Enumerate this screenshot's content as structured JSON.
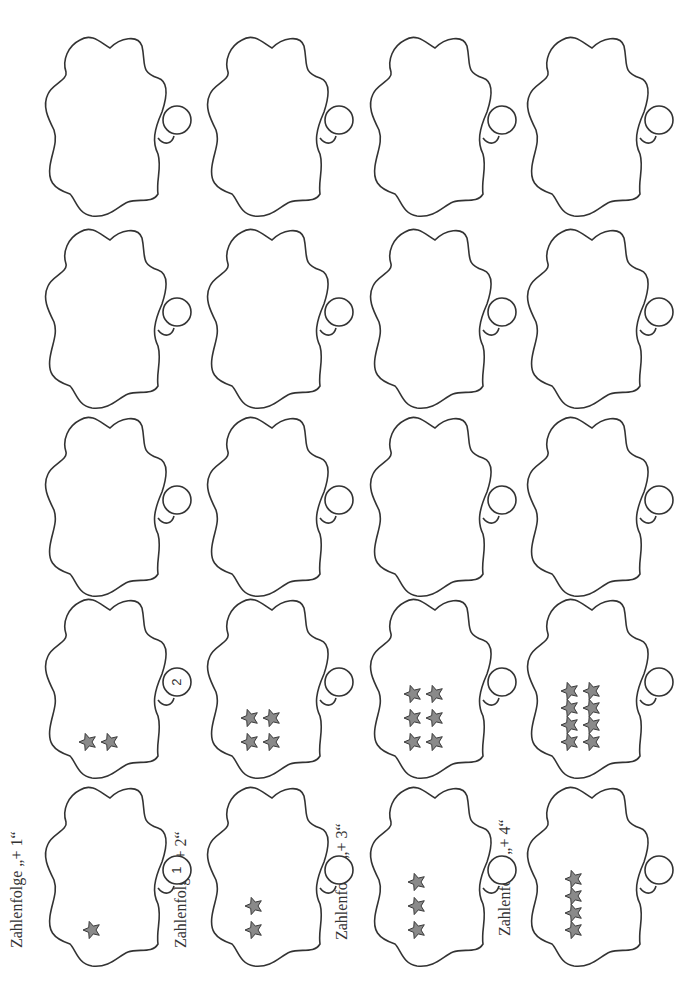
{
  "page": {
    "orientation": "rotated-90-ccw",
    "colors": {
      "outline": "#333333",
      "star_fill": "#8a8a8a",
      "star_stroke": "#3a3a3a",
      "background": "#ffffff"
    }
  },
  "rows": [
    {
      "label": "Zahlenfolge „+ 1“",
      "step": 1,
      "cells": [
        {
          "stars": 1,
          "bubble_number": "1"
        },
        {
          "stars": 2,
          "bubble_number": "2"
        },
        {
          "stars": 0,
          "bubble_number": ""
        },
        {
          "stars": 0,
          "bubble_number": ""
        },
        {
          "stars": 0,
          "bubble_number": ""
        }
      ]
    },
    {
      "label": "Zahlenfolge „+ 2“",
      "step": 2,
      "cells": [
        {
          "stars": 2,
          "bubble_number": ""
        },
        {
          "stars": 4,
          "bubble_number": ""
        },
        {
          "stars": 0,
          "bubble_number": ""
        },
        {
          "stars": 0,
          "bubble_number": ""
        },
        {
          "stars": 0,
          "bubble_number": ""
        }
      ]
    },
    {
      "label": "Zahlenfolge „+ 3“",
      "step": 3,
      "cells": [
        {
          "stars": 3,
          "bubble_number": ""
        },
        {
          "stars": 6,
          "bubble_number": ""
        },
        {
          "stars": 0,
          "bubble_number": ""
        },
        {
          "stars": 0,
          "bubble_number": ""
        },
        {
          "stars": 0,
          "bubble_number": ""
        }
      ]
    },
    {
      "label": "Zahlenfolge „+ 4“",
      "step": 4,
      "cells": [
        {
          "stars": 4,
          "bubble_number": ""
        },
        {
          "stars": 8,
          "bubble_number": ""
        },
        {
          "stars": 0,
          "bubble_number": ""
        },
        {
          "stars": 0,
          "bubble_number": ""
        },
        {
          "stars": 0,
          "bubble_number": ""
        }
      ]
    }
  ]
}
